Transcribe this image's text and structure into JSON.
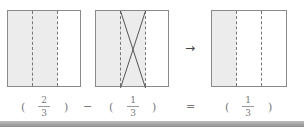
{
  "diagram": {
    "boxes": [
      {
        "name": "two-thirds",
        "parts": 3,
        "shaded": 2,
        "crossed": []
      },
      {
        "name": "two-thirds-minus-one",
        "parts": 3,
        "shaded": 2,
        "crossed": [
          2
        ]
      },
      {
        "name": "one-third-result",
        "parts": 3,
        "shaded": 1,
        "crossed": []
      }
    ],
    "arrow": "→",
    "equation": {
      "term1": {
        "open": "(",
        "num": "2",
        "den": "3",
        "close": ")"
      },
      "minus": "−",
      "term2": {
        "open": "(",
        "num": "1",
        "den": "3",
        "close": ")"
      },
      "equals": "=",
      "result": {
        "open": "(",
        "num": "1",
        "den": "3",
        "close": ")"
      }
    },
    "colors": {
      "shade": "#ececec",
      "border": "#8a8a8a",
      "bottom_bar": "#9a9a9a"
    }
  }
}
